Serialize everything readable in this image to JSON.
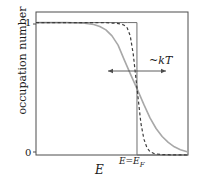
{
  "figure": {
    "width": 200,
    "height": 186,
    "background": "#ffffff"
  },
  "axes": {
    "frame": {
      "left": 36,
      "top": 12,
      "right": 188,
      "bottom": 155
    },
    "y_label": "occupation number",
    "y_ticks": [
      "1",
      "0"
    ],
    "x_label": "E",
    "x_marker_label": "E=E",
    "x_marker_subscript": "F"
  },
  "annotation": {
    "tilde": "~",
    "kt": "kT",
    "arrow": {
      "x1": 108,
      "x2": 166,
      "y": 71
    }
  },
  "colors": {
    "frame": "#4d4d4d",
    "step_curve": "#6e6e6e",
    "dashed_curve": "#3d3d3d",
    "smooth_curve": "#a8a8a8",
    "annotation": "#4d4d4d",
    "text": "#1a1a1a"
  },
  "chart_data": {
    "type": "line",
    "title": "",
    "xlabel": "E",
    "ylabel": "occupation number",
    "xlim": [
      0,
      1
    ],
    "ylim": [
      0,
      1.08
    ],
    "grid": false,
    "legend": null,
    "x_tick_labels": [
      "E=E_F"
    ],
    "y_tick_labels": [
      "0",
      "1"
    ],
    "annotations": [
      {
        "text": "~kT",
        "type": "double-arrow-width",
        "x_center": 0.665,
        "y": 0.59
      }
    ],
    "fermi_level_x": 0.665,
    "series": [
      {
        "name": "T = 0 step function",
        "style": "solid",
        "color": "#6e6e6e",
        "x": [
          0.0,
          0.2,
          0.4,
          0.6,
          0.664,
          0.6645,
          0.7,
          0.85,
          1.0
        ],
        "values": [
          1.0,
          1.0,
          1.0,
          1.0,
          1.0,
          0.0,
          0.0,
          0.0,
          0.0
        ]
      },
      {
        "name": "low temperature Fermi-Dirac",
        "style": "dashed",
        "color": "#3d3d3d",
        "x": [
          0.0,
          0.3,
          0.45,
          0.52,
          0.56,
          0.58,
          0.6,
          0.62,
          0.64,
          0.665,
          0.69,
          0.71,
          0.73,
          0.75,
          0.78,
          0.82,
          0.9,
          1.0
        ],
        "values": [
          1.0,
          1.0,
          1.0,
          0.995,
          0.99,
          0.98,
          0.96,
          0.9,
          0.76,
          0.5,
          0.24,
          0.12,
          0.055,
          0.025,
          0.01,
          0.004,
          0.001,
          0.0
        ]
      },
      {
        "name": "higher temperature Fermi-Dirac",
        "style": "solid",
        "color": "#a8a8a8",
        "x": [
          0.0,
          0.2,
          0.32,
          0.38,
          0.42,
          0.46,
          0.5,
          0.54,
          0.58,
          0.62,
          0.665,
          0.71,
          0.75,
          0.79,
          0.83,
          0.87,
          0.91,
          0.95,
          1.0
        ],
        "values": [
          1.0,
          1.0,
          0.995,
          0.985,
          0.97,
          0.945,
          0.9,
          0.83,
          0.72,
          0.615,
          0.5,
          0.38,
          0.28,
          0.2,
          0.14,
          0.095,
          0.062,
          0.04,
          0.022
        ]
      }
    ]
  }
}
